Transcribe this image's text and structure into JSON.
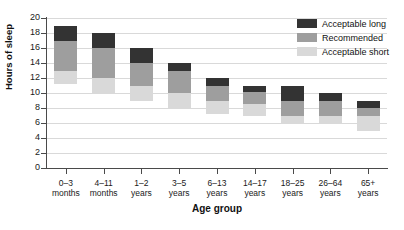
{
  "chart_data": {
    "type": "bar",
    "stacked": true,
    "title": "",
    "xlabel": "Age group",
    "ylabel": "Hours of sleep",
    "ylim": [
      0,
      20
    ],
    "ytick_step": 2,
    "yticks": [
      0,
      2,
      4,
      6,
      8,
      10,
      12,
      14,
      16,
      18,
      20
    ],
    "grid": true,
    "legend_position": "top-right",
    "categories": [
      "0–3\nmonths",
      "4–11\nmonths",
      "1–2\nyears",
      "3–5\nyears",
      "6–13\nyears",
      "14–17\nyears",
      "18–25\nyears",
      "26–64\nyears",
      "65+\nyears"
    ],
    "category_labels": [
      {
        "line1": "0–3",
        "line2": "months"
      },
      {
        "line1": "4–11",
        "line2": "months"
      },
      {
        "line1": "1–2",
        "line2": "years"
      },
      {
        "line1": "3–5",
        "line2": "years"
      },
      {
        "line1": "6–13",
        "line2": "years"
      },
      {
        "line1": "14–17",
        "line2": "years"
      },
      {
        "line1": "18–25",
        "line2": "years"
      },
      {
        "line1": "26–64",
        "line2": "years"
      },
      {
        "line1": "65+",
        "line2": "years"
      }
    ],
    "bands": [
      {
        "name": "Acceptable short",
        "color": "#d9d9d9",
        "low": [
          11.2,
          10.0,
          9.0,
          8.0,
          7.2,
          7.0,
          6.0,
          6.0,
          5.0
        ],
        "high": [
          13.0,
          12.0,
          11.0,
          10.0,
          9.0,
          8.5,
          7.0,
          7.0,
          7.0
        ]
      },
      {
        "name": "Recommended",
        "color": "#9e9e9e",
        "low": [
          13.0,
          12.0,
          11.0,
          10.0,
          9.0,
          8.5,
          7.0,
          7.0,
          7.0
        ],
        "high": [
          17.0,
          16.0,
          14.0,
          13.0,
          11.0,
          10.2,
          9.0,
          9.0,
          8.0
        ]
      },
      {
        "name": "Acceptable long",
        "color": "#333333",
        "low": [
          17.0,
          16.0,
          14.0,
          13.0,
          11.0,
          10.2,
          9.0,
          9.0,
          8.0
        ],
        "high": [
          19.0,
          18.0,
          16.0,
          14.0,
          12.0,
          11.0,
          11.0,
          10.0,
          9.0
        ]
      }
    ],
    "bar_ranges": [
      {
        "category": "0–3 months",
        "min": 11.2,
        "max": 19.0
      },
      {
        "category": "4–11 months",
        "min": 10.0,
        "max": 18.0
      },
      {
        "category": "1–2 years",
        "min": 9.0,
        "max": 16.0
      },
      {
        "category": "3–5 years",
        "min": 8.0,
        "max": 14.0
      },
      {
        "category": "6–13 years",
        "min": 7.2,
        "max": 12.0
      },
      {
        "category": "14–17 years",
        "min": 7.0,
        "max": 11.0
      },
      {
        "category": "18–25 years",
        "min": 6.0,
        "max": 11.0
      },
      {
        "category": "26–64 years",
        "min": 6.0,
        "max": 10.0
      },
      {
        "category": "65+ years",
        "min": 5.0,
        "max": 9.0
      }
    ]
  },
  "legend": {
    "items": [
      {
        "label": "Acceptable long",
        "color": "#333333"
      },
      {
        "label": "Recommended",
        "color": "#9e9e9e"
      },
      {
        "label": "Acceptable short",
        "color": "#d9d9d9"
      }
    ]
  },
  "axes": {
    "y_title": "Hours of sleep",
    "x_title": "Age group"
  },
  "colors": {
    "acceptable_long": "#333333",
    "recommended": "#9e9e9e",
    "acceptable_short": "#d9d9d9",
    "grid": "#d9d9d9",
    "axis": "#4a4a4a",
    "text": "#111111",
    "background": "#ffffff"
  }
}
